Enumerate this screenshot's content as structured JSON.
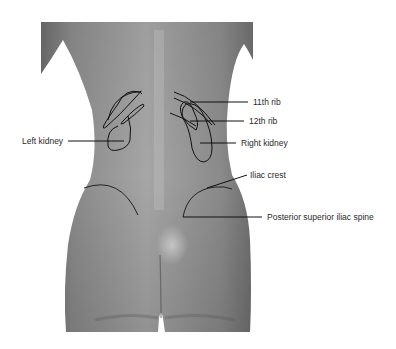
{
  "figure": {
    "labels": {
      "left_kidney": "Left kidney",
      "rib_11": "11th rib",
      "rib_12": "12th rib",
      "right_kidney": "Right kidney",
      "iliac_crest": "Iliac crest",
      "psis": "Posterior superior iliac spine"
    }
  },
  "colors": {
    "background": "#ffffff",
    "skin_dark": "#6e6e6e",
    "skin_mid": "#8e8e8e",
    "skin_light": "#b4b4b4",
    "annotation": "#111111",
    "label_text": "#2a2a2a"
  }
}
